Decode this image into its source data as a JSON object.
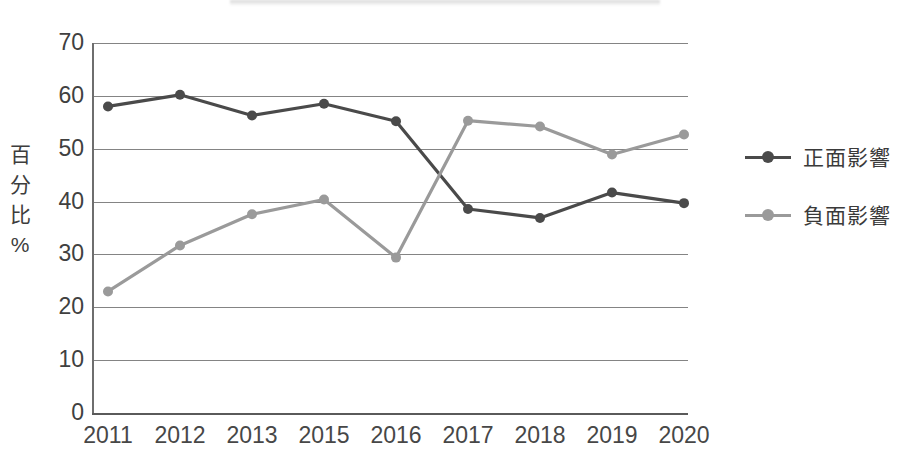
{
  "chart_data": {
    "type": "line",
    "title": "",
    "xlabel": "",
    "ylabel": "百分比%",
    "categories": [
      "2011",
      "2012",
      "2013",
      "2015",
      "2016",
      "2017",
      "2018",
      "2019",
      "2020"
    ],
    "ylim": [
      0,
      70
    ],
    "ytick_step": 10,
    "yticks": [
      "70",
      "60",
      "50",
      "40",
      "30",
      "20",
      "10",
      "0"
    ],
    "grid": true,
    "legend_position": "right",
    "series": [
      {
        "name": "正面影響",
        "color": "#4a4a4a",
        "values": [
          58.0,
          60.2,
          56.3,
          58.5,
          55.2,
          38.6,
          36.9,
          41.7,
          39.7
        ]
      },
      {
        "name": "負面影響",
        "color": "#9a9a9a",
        "values": [
          23.0,
          31.7,
          37.6,
          40.4,
          29.4,
          55.3,
          54.2,
          48.9,
          52.7
        ]
      }
    ]
  },
  "axis": {
    "y_title_chars": [
      "百",
      "分",
      "比",
      "%"
    ]
  },
  "legend": {
    "items": [
      {
        "label": "正面影響",
        "color": "#4a4a4a"
      },
      {
        "label": "負面影響",
        "color": "#9a9a9a"
      }
    ]
  }
}
